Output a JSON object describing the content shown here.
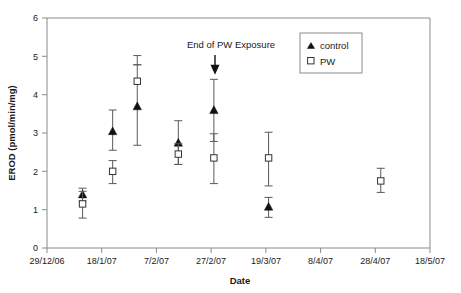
{
  "chart_data": {
    "type": "scatter",
    "title": "",
    "xlabel": "Date",
    "ylabel": "EROD (pmol/min/mg)",
    "ylim": [
      0,
      6
    ],
    "yticks": [
      0,
      1,
      2,
      3,
      4,
      5,
      6
    ],
    "ytick_labels": [
      "0",
      "1",
      "2",
      "3",
      "4",
      "5",
      "6"
    ],
    "xtick_labels": [
      "29/12/06",
      "18/1/07",
      "7/2/07",
      "27/2/07",
      "19/3/07",
      "8/4/07",
      "28/4/07",
      "18/5/07"
    ],
    "xtick_positions": [
      0,
      20,
      40,
      60,
      80,
      100,
      120,
      140
    ],
    "xlim_days": [
      0,
      140
    ],
    "grid": false,
    "legend_position": "top-right",
    "annotations": [
      {
        "text": "End  of PW Exposure",
        "arrow": "down",
        "x_day": 59,
        "y_value": 5.25
      }
    ],
    "series": [
      {
        "name": "control",
        "marker": "filled-triangle",
        "color": "#111111",
        "points": [
          {
            "x_day": 13,
            "y": 1.4,
            "err_low": 1.22,
            "err_high": 1.56
          },
          {
            "x_day": 24,
            "y": 3.05,
            "err_low": 2.55,
            "err_high": 3.6
          },
          {
            "x_day": 33,
            "y": 3.7,
            "err_low": 2.68,
            "err_high": 5.02
          },
          {
            "x_day": 48,
            "y": 2.75,
            "err_low": 2.18,
            "err_high": 3.32
          },
          {
            "x_day": 61,
            "y": 3.6,
            "err_low": 2.78,
            "err_high": 4.4
          },
          {
            "x_day": 81,
            "y": 1.08,
            "err_low": 0.8,
            "err_high": 1.32
          }
        ]
      },
      {
        "name": "PW",
        "marker": "open-square",
        "color": "#333333",
        "points": [
          {
            "x_day": 13,
            "y": 1.15,
            "err_low": 0.78,
            "err_high": 1.48
          },
          {
            "x_day": 24,
            "y": 2.0,
            "err_low": 1.68,
            "err_high": 2.28
          },
          {
            "x_day": 33,
            "y": 4.35,
            "err_low": 4.78,
            "err_high": 4.78
          },
          {
            "x_day": 48,
            "y": 2.45,
            "err_low": 2.18,
            "err_high": 2.72
          },
          {
            "x_day": 61,
            "y": 2.35,
            "err_low": 1.68,
            "err_high": 2.98
          },
          {
            "x_day": 81,
            "y": 2.35,
            "err_low": 1.62,
            "err_high": 3.02
          },
          {
            "x_day": 122,
            "y": 1.75,
            "err_low": 1.45,
            "err_high": 2.08
          }
        ]
      }
    ],
    "legend": [
      {
        "label": "control",
        "marker": "filled-triangle"
      },
      {
        "label": "PW",
        "marker": "open-square"
      }
    ]
  }
}
